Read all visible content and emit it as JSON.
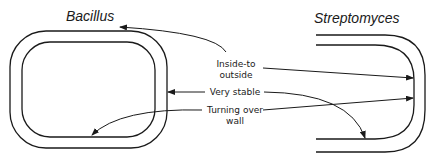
{
  "diagram": {
    "left_organism": {
      "title": "Bacillus"
    },
    "right_organism": {
      "title": "Streptomyces"
    },
    "labels": {
      "inside_to_outside_line1": "Inside-to",
      "inside_to_outside_line2": "outside",
      "very_stable": "Very   stable",
      "turning_over_line1": "Turning  over",
      "turning_over_line2": "wall"
    },
    "colors": {
      "stroke": "#1a1a1a",
      "background": "#ffffff"
    }
  }
}
